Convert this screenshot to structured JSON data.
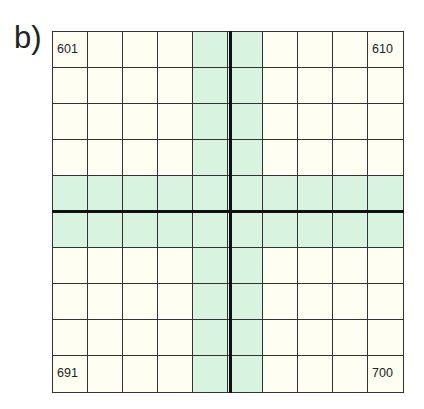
{
  "label": "b)",
  "grid": {
    "rows": 10,
    "cols": 10,
    "highlight_cols": [
      5,
      6
    ],
    "highlight_rows": [
      5,
      6
    ],
    "colors": {
      "background": "#fffef2",
      "highlight": "#d8f3df",
      "lines": "#333333"
    },
    "corner_numbers": {
      "top_left": "601",
      "top_right": "610",
      "bottom_left": "691",
      "bottom_right": "700"
    }
  }
}
